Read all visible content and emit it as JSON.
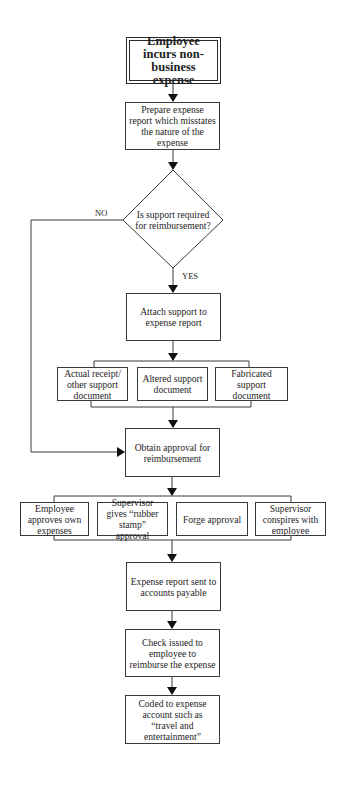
{
  "flowchart": {
    "start": "Employee incurs non-business expense",
    "prepare": "Prepare expense report which misstates the nature of the expense",
    "decision": "Is support required for reimbursement?",
    "decision_no_label": "NO",
    "decision_yes_label": "YES",
    "attach": "Attach support to expense report",
    "support_options": [
      "Actual receipt/ other support document",
      "Altered support document",
      "Fabricated support document"
    ],
    "obtain_approval": "Obtain approval for reimbursement",
    "approval_options": [
      "Employee approves own expenses",
      "Supervisor gives “rubber stamp” approval",
      "Forge approval",
      "Supervisor conspires with employee"
    ],
    "sent_to_ap": "Expense report sent to accounts payable",
    "check_issued": "Check issued to employee to reimburse the expense",
    "coded": "Coded to expense account such as “travel and entertainment”"
  }
}
